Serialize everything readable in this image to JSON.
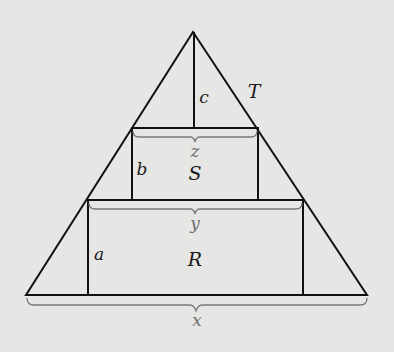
{
  "diagram": {
    "title": "",
    "labels": {
      "triangle": "T",
      "upper_rect": "S",
      "lower_rect": "R",
      "height_c": "c",
      "height_b": "b",
      "height_a": "a",
      "width_z": "z",
      "width_y": "y",
      "width_x": "x"
    },
    "colors": {
      "background": "#e6e6e4",
      "stroke": "#111111",
      "brace": "#7a7a7a",
      "label": "#1a1a1a",
      "brace_label": "#707070"
    },
    "shapes": {
      "triangle_T": {
        "apex": [
          193,
          32
        ],
        "base_left": [
          26,
          295
        ],
        "base_right": [
          367,
          295
        ]
      },
      "rect_S": {
        "x1": 132,
        "y1": 128,
        "x2": 258,
        "y2": 200
      },
      "rect_R": {
        "x1": 88,
        "y1": 200,
        "x2": 303,
        "y2": 295
      },
      "segment_c": {
        "x": 194,
        "y1": 32,
        "y2": 128
      }
    }
  }
}
